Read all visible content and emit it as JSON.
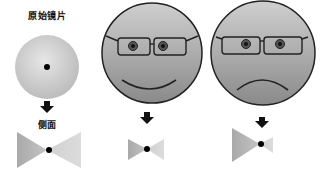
{
  "diagram": {
    "labels": {
      "original_lens": "原始镜片",
      "side_view": "侧面"
    },
    "panels": [
      {
        "id": "original-lens",
        "type": "lens-front",
        "mood": "none",
        "side_profile": "symmetric"
      },
      {
        "id": "happy-face",
        "type": "face-with-glasses",
        "mood": "smile",
        "side_profile": "symmetric-small"
      },
      {
        "id": "sad-face",
        "type": "face-with-glasses",
        "mood": "frown",
        "side_profile": "asymmetric"
      }
    ],
    "colors": {
      "lens_fill_light": "#e2e2e2",
      "lens_fill_dark": "#bdbdbd",
      "face_fill_light": "#c8c8c8",
      "face_fill_dark": "#8f8f8f",
      "outline": "#222222",
      "triangle_left": "#b5b5b5",
      "triangle_right": "#d6d6d6",
      "dot": "#000000",
      "arrow": "#111111"
    }
  }
}
